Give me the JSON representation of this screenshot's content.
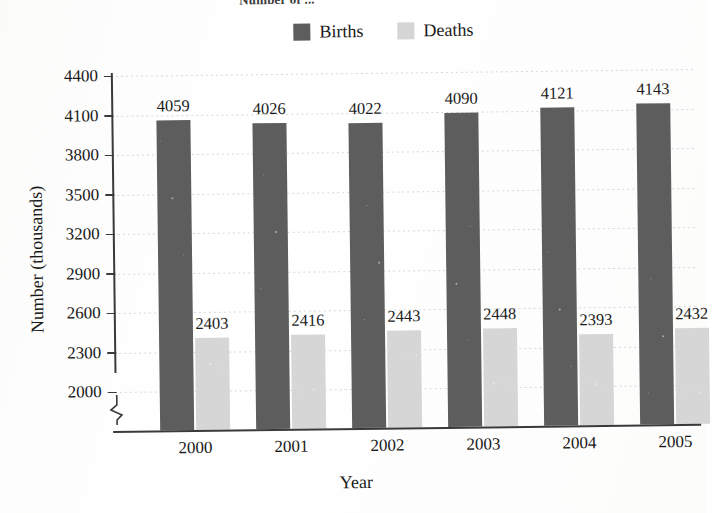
{
  "figure": {
    "clipped_title": "Number of ...",
    "x_axis_title": "Year",
    "y_axis_title": "Number (thousands)"
  },
  "legend": {
    "position": "top-center",
    "entries": [
      {
        "label": "Births",
        "color": "#5d5d5e",
        "swatch_name": "legend-swatch-births"
      },
      {
        "label": "Deaths",
        "color": "#d5d5d5",
        "swatch_name": "legend-swatch-deaths"
      }
    ]
  },
  "axes": {
    "y_ticks": [
      "4400",
      "4100",
      "3800",
      "3500",
      "3200",
      "2900",
      "2600",
      "2300",
      "2000"
    ],
    "y_tick_values": [
      4400,
      4100,
      3800,
      3500,
      3200,
      2900,
      2600,
      2300,
      2000
    ],
    "y_has_break": true,
    "x_ticks": [
      "2000",
      "2001",
      "2002",
      "2003",
      "2004",
      "2005"
    ]
  },
  "chart_data": {
    "type": "bar",
    "title": "Number of ...",
    "xlabel": "Year",
    "ylabel": "Number (thousands)",
    "categories": [
      "2000",
      "2001",
      "2002",
      "2003",
      "2004",
      "2005"
    ],
    "series": [
      {
        "name": "Births",
        "color": "#5d5d5e",
        "values": [
          4059,
          4026,
          4022,
          4090,
          4121,
          4143
        ],
        "labels": [
          "4059",
          "4026",
          "4022",
          "4090",
          "4121",
          "4143"
        ]
      },
      {
        "name": "Deaths",
        "color": "#d6d6d6",
        "values": [
          2403,
          2416,
          2443,
          2448,
          2393,
          2432
        ],
        "labels": [
          "2403",
          "2416",
          "2443",
          "2448",
          "2393",
          "2432"
        ]
      }
    ],
    "ylim": [
      2000,
      4400
    ],
    "y_tick_step": 300,
    "axis_break_below": 2000,
    "grid": true,
    "grid_axis": "y",
    "legend_position": "top-center",
    "bar_labels_shown": true
  }
}
